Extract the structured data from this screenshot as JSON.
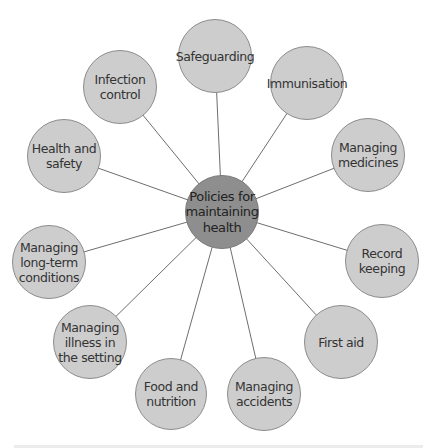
{
  "diagram": {
    "type": "spider-diagram",
    "colors": {
      "node_fill": "#cdcdcd",
      "hub_fill": "#8e8e8e",
      "stroke": "#8c8c8c",
      "connector": "#6e6e6e",
      "text": "#333333"
    },
    "center": {
      "label": "Policies for\nmaintaining\nhealth",
      "x": 222,
      "y": 212,
      "r": 37
    },
    "nodes": [
      {
        "label": "Safeguarding",
        "x": 215,
        "y": 56,
        "r": 37
      },
      {
        "label": "Immunisation",
        "x": 307,
        "y": 83,
        "r": 37
      },
      {
        "label": "Managing\nmedicines",
        "x": 368,
        "y": 155,
        "r": 37
      },
      {
        "label": "Record\nkeeping",
        "x": 382,
        "y": 261,
        "r": 37
      },
      {
        "label": "First aid",
        "x": 341,
        "y": 342,
        "r": 37
      },
      {
        "label": "Managing\naccidents",
        "x": 264,
        "y": 394,
        "r": 37
      },
      {
        "label": "Food and\nnutrition",
        "x": 171,
        "y": 394,
        "r": 36
      },
      {
        "label": "Managing\nillness in\nthe setting",
        "x": 90,
        "y": 342,
        "r": 37
      },
      {
        "label": "Managing\nlong-term\nconditions",
        "x": 49,
        "y": 262,
        "r": 37
      },
      {
        "label": "Health and\nsafety",
        "x": 64,
        "y": 156,
        "r": 37
      },
      {
        "label": "Infection\ncontrol",
        "x": 120,
        "y": 87,
        "r": 37
      }
    ]
  }
}
